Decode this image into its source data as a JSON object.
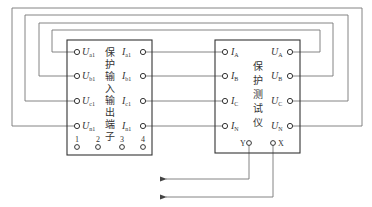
{
  "left_device": {
    "title_chars": [
      "保",
      "护",
      "输",
      "入",
      "输",
      "出",
      "端",
      "子"
    ],
    "left_terminals": [
      {
        "main": "U",
        "sub": "a1"
      },
      {
        "main": "U",
        "sub": "b1"
      },
      {
        "main": "U",
        "sub": "c1"
      },
      {
        "main": "U",
        "sub": "n1"
      }
    ],
    "right_terminals": [
      {
        "main": "I",
        "sub": "a1"
      },
      {
        "main": "I",
        "sub": "b1"
      },
      {
        "main": "I",
        "sub": "c1"
      },
      {
        "main": "I",
        "sub": "n1"
      }
    ],
    "bottom_terminals": [
      "1",
      "2",
      "3",
      "4"
    ]
  },
  "right_device": {
    "title_chars": [
      "保",
      "护",
      "测",
      "试",
      "仪"
    ],
    "left_terminals": [
      {
        "main": "I",
        "sub": "A"
      },
      {
        "main": "I",
        "sub": "B"
      },
      {
        "main": "I",
        "sub": "C"
      },
      {
        "main": "I",
        "sub": "N"
      }
    ],
    "right_terminals": [
      {
        "main": "U",
        "sub": "A"
      },
      {
        "main": "U",
        "sub": "B"
      },
      {
        "main": "U",
        "sub": "C"
      },
      {
        "main": "U",
        "sub": "N"
      }
    ],
    "bottom_terminals": [
      "Y",
      "X"
    ]
  },
  "colors": {
    "box": "#333333",
    "wire": "#777777",
    "background": "#ffffff"
  }
}
